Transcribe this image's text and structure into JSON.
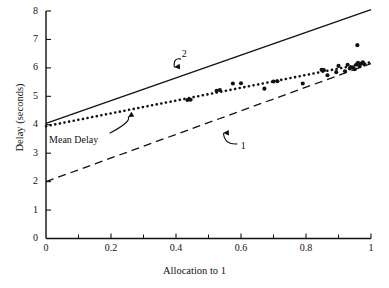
{
  "chart_data": {
    "type": "scatter",
    "title": "",
    "xlabel": "Allocation to 1",
    "ylabel": "Delay (seconds)",
    "xlim": [
      0,
      1
    ],
    "ylim": [
      0,
      8
    ],
    "grid": false,
    "legend_position": "none",
    "xticks": [
      0,
      0.2,
      0.4,
      0.6,
      0.8,
      1
    ],
    "xticklabels": [
      "0",
      "0.2",
      "0.4",
      "0.6",
      "0.8",
      "1"
    ],
    "xminorticks": [
      0.1,
      0.3,
      0.5,
      0.7,
      0.9
    ],
    "yticks": [
      0,
      1,
      2,
      3,
      4,
      5,
      6,
      7,
      8
    ],
    "yticklabels": [
      "0",
      "1",
      "2",
      "3",
      "4",
      "5",
      "6",
      "7",
      "8"
    ],
    "series": [
      {
        "name": "2",
        "style": "solid",
        "type": "line",
        "points": [
          [
            0,
            4.05
          ],
          [
            1,
            8.05
          ]
        ]
      },
      {
        "name": "Mean Delay",
        "style": "dotted",
        "type": "line",
        "points": [
          [
            0,
            3.95
          ],
          [
            1,
            6.2
          ]
        ]
      },
      {
        "name": "1",
        "style": "dashed",
        "type": "line",
        "points": [
          [
            0,
            2.0
          ],
          [
            1,
            6.15
          ]
        ]
      },
      {
        "name": "observations",
        "style": "markers",
        "type": "scatter",
        "points": [
          [
            0.435,
            4.87
          ],
          [
            0.445,
            4.88
          ],
          [
            0.525,
            5.19
          ],
          [
            0.535,
            5.22
          ],
          [
            0.575,
            5.45
          ],
          [
            0.6,
            5.46
          ],
          [
            0.672,
            5.27
          ],
          [
            0.7,
            5.52
          ],
          [
            0.712,
            5.53
          ],
          [
            0.79,
            5.45
          ],
          [
            0.848,
            5.93
          ],
          [
            0.855,
            5.92
          ],
          [
            0.866,
            5.74
          ],
          [
            0.893,
            5.85
          ],
          [
            0.9,
            6.07
          ],
          [
            0.92,
            5.88
          ],
          [
            0.928,
            6.11
          ],
          [
            0.935,
            5.98
          ],
          [
            0.944,
            6.02
          ],
          [
            0.95,
            5.95
          ],
          [
            0.955,
            6.12
          ],
          [
            0.96,
            6.18
          ],
          [
            0.965,
            6.05
          ],
          [
            0.97,
            6.15
          ],
          [
            0.975,
            6.2
          ],
          [
            0.98,
            6.13
          ],
          [
            0.958,
            6.8
          ]
        ]
      }
    ],
    "annotations": [
      {
        "text": "2",
        "x": 0.425,
        "y": 6.45,
        "target_x": 0.395,
        "target_y": 5.85
      },
      {
        "text": "Mean Delay",
        "x": 0.085,
        "y": 3.42,
        "target_x": 0.25,
        "target_y": 4.45
      },
      {
        "text": "1",
        "x": 0.607,
        "y": 3.22,
        "target_x": 0.54,
        "target_y": 3.92
      }
    ]
  },
  "axis": {
    "x_title": "Allocation to 1",
    "y_title": "Delay (seconds)"
  }
}
